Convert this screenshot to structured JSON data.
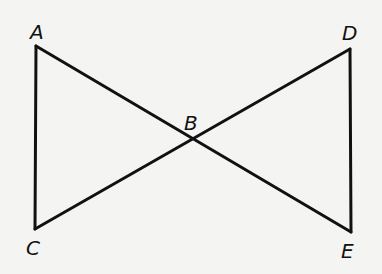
{
  "diagram": {
    "type": "geometry",
    "stroke_color": "#111111",
    "background_color": "#f4f4f2",
    "points": {
      "A": {
        "label": "A",
        "x": 36,
        "y": 46
      },
      "B": {
        "label": "B",
        "x": 193,
        "y": 139
      },
      "C": {
        "label": "C",
        "x": 35,
        "y": 229
      },
      "D": {
        "label": "D",
        "x": 350,
        "y": 49
      },
      "E": {
        "label": "E",
        "x": 351,
        "y": 232
      }
    },
    "segments": [
      {
        "from": "A",
        "to": "E"
      },
      {
        "from": "C",
        "to": "D"
      },
      {
        "from": "A",
        "to": "C"
      },
      {
        "from": "D",
        "to": "E"
      }
    ]
  }
}
